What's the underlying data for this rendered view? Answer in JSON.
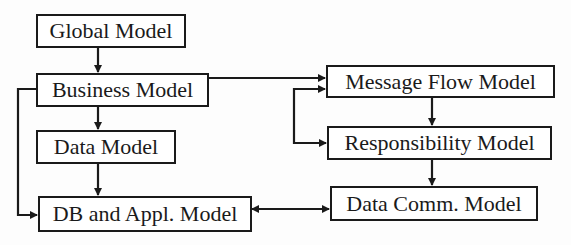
{
  "diagram": {
    "type": "flowchart",
    "nodes": {
      "global_model": "Global Model",
      "business_model": "Business Model",
      "data_model": "Data Model",
      "db_appl_model": "DB and Appl. Model",
      "message_flow_model": "Message Flow Model",
      "responsibility_model": "Responsibility Model",
      "data_comm_model": "Data Comm. Model"
    },
    "edges": [
      {
        "from": "Global Model",
        "to": "Business Model"
      },
      {
        "from": "Business Model",
        "to": "Data Model"
      },
      {
        "from": "Data Model",
        "to": "DB and Appl. Model"
      },
      {
        "from": "Business Model",
        "to": "DB and Appl. Model"
      },
      {
        "from": "Business Model",
        "to": "Message Flow Model"
      },
      {
        "from": "Message Flow Model",
        "to": "Responsibility Model"
      },
      {
        "from": "Responsibility Model",
        "to": "Message Flow Model",
        "bidirectional": true
      },
      {
        "from": "Responsibility Model",
        "to": "Data Comm. Model"
      },
      {
        "from": "DB and Appl. Model",
        "to": "Data Comm. Model",
        "bidirectional": true
      }
    ],
    "colors": {
      "line": "#1a1a1a",
      "background": "#ffffff"
    }
  }
}
